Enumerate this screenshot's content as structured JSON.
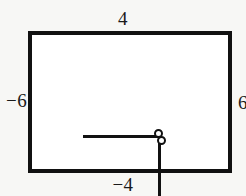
{
  "figure": {
    "background_color": "#f7f7f5",
    "plot_background_color": "#ffffff",
    "line_color": "#111111",
    "border_color": "#111111"
  },
  "labels": {
    "top": "4",
    "bottom": "−4",
    "left": "−6",
    "right": "6"
  },
  "chart_data": {
    "type": "line",
    "title": "",
    "xlabel": "",
    "ylabel": "",
    "xlim": [
      -6,
      6
    ],
    "ylim": [
      -4,
      4
    ],
    "grid": false,
    "legend": null,
    "axis_edge_labels": {
      "top": 4,
      "bottom": -4,
      "left": -6,
      "right": 6
    },
    "series": [
      {
        "name": "horizontal-segment",
        "x": [
          -4.6,
          0.2
        ],
        "y": [
          0.05,
          0.05
        ]
      },
      {
        "name": "vertical-segment",
        "x": [
          0.2,
          0.2
        ],
        "y": [
          0.05,
          -3.6
        ]
      }
    ],
    "markers": [
      {
        "name": "node-upper",
        "x": 0.15,
        "y": 0.22
      },
      {
        "name": "node-lower",
        "x": 0.33,
        "y": -0.17
      }
    ],
    "annotations": [
      {
        "name": "dotted-marks",
        "type": "dotted-vertical",
        "dots": 4,
        "x": 5.45,
        "y_range": [
          3.45,
          2.3
        ]
      }
    ]
  }
}
